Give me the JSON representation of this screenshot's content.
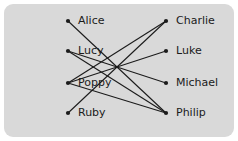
{
  "diagram": {
    "type": "bipartite-graph",
    "title": "",
    "background_color": "#d9d9d9",
    "edge_color": "#1b1b1b",
    "node_color": "#1b1b1b",
    "label_color": "#1b1b1b",
    "left_column": {
      "name": "left-set",
      "nodes": [
        {
          "id": "alice",
          "label": "Alice",
          "x": 68,
          "y": 21
        },
        {
          "id": "lucy",
          "label": "Lucy",
          "x": 68,
          "y": 51
        },
        {
          "id": "poppy",
          "label": "Poppy",
          "x": 68,
          "y": 83
        },
        {
          "id": "ruby",
          "label": "Ruby",
          "x": 68,
          "y": 113
        }
      ]
    },
    "right_column": {
      "name": "right-set",
      "nodes": [
        {
          "id": "charlie",
          "label": "Charlie",
          "x": 166,
          "y": 21
        },
        {
          "id": "luke",
          "label": "Luke",
          "x": 166,
          "y": 51
        },
        {
          "id": "michael",
          "label": "Michael",
          "x": 166,
          "y": 83
        },
        {
          "id": "philip",
          "label": "Philip",
          "x": 166,
          "y": 113
        }
      ]
    },
    "edges": [
      {
        "from": "alice",
        "to": "philip"
      },
      {
        "from": "lucy",
        "to": "michael"
      },
      {
        "from": "lucy",
        "to": "philip"
      },
      {
        "from": "poppy",
        "to": "charlie"
      },
      {
        "from": "poppy",
        "to": "luke"
      },
      {
        "from": "poppy",
        "to": "philip"
      },
      {
        "from": "ruby",
        "to": "charlie"
      }
    ]
  }
}
